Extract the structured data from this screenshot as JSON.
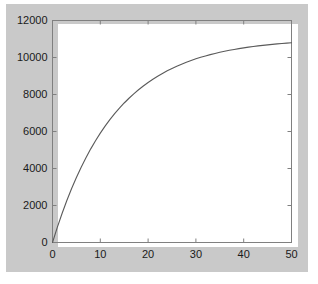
{
  "figure": {
    "background_color": "#c9c9c9",
    "axes_background_color": "#ffffff",
    "axes_line_color": "#808080",
    "line_color": "#5a5a5a",
    "outer_margin_color": "#ffffff"
  },
  "chart_data": {
    "type": "line",
    "title": "",
    "subtitle": "",
    "xlabel": "",
    "ylabel": "",
    "xlim": [
      0,
      50
    ],
    "ylim": [
      0,
      12000
    ],
    "grid": false,
    "legend": null,
    "legend_position": "none",
    "box": true,
    "tick_direction": "in",
    "x_ticks": [
      0,
      10,
      20,
      30,
      40,
      50
    ],
    "x_tick_labels": [
      "0",
      "10",
      "20",
      "30",
      "40",
      "50"
    ],
    "y_ticks": [
      0,
      2000,
      4000,
      6000,
      8000,
      10000,
      12000
    ],
    "y_tick_labels": [
      "0",
      "2000",
      "4000",
      "6000",
      "8000",
      "10000",
      "12000"
    ],
    "series": [
      {
        "name": "curve",
        "style": "solid",
        "marker": "none",
        "color": "#5a5a5a",
        "x": [
          0,
          1,
          2,
          3,
          4,
          5,
          6,
          7,
          8,
          9,
          10,
          11,
          12,
          13,
          14,
          15,
          16,
          17,
          18,
          19,
          20,
          21,
          22,
          23,
          24,
          25,
          26,
          27,
          28,
          29,
          30,
          31,
          32,
          33,
          34,
          35,
          36,
          37,
          38,
          39,
          40,
          41,
          42,
          43,
          44,
          45,
          46,
          47,
          48,
          49,
          50
        ],
        "y": [
          0,
          815,
          1570,
          2270,
          2917,
          3516,
          4072,
          4586,
          5062,
          5503,
          5911,
          6289,
          6639,
          6963,
          7263,
          7541,
          7798,
          8036,
          8257,
          8461,
          8651,
          8826,
          8989,
          9140,
          9280,
          9409,
          9529,
          9640,
          9743,
          9838,
          9927,
          10009,
          10085,
          10155,
          10220,
          10280,
          10336,
          10388,
          10436,
          10480,
          10521,
          10559,
          10594,
          10627,
          10657,
          10685,
          10711,
          10735,
          10757,
          10778,
          10797
        ]
      }
    ],
    "annotations": []
  }
}
